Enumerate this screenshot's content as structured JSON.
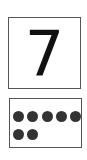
{
  "card": {
    "numeral": "7",
    "dot_count": 7,
    "dot_color": "#333333",
    "border_color": "#555555"
  }
}
